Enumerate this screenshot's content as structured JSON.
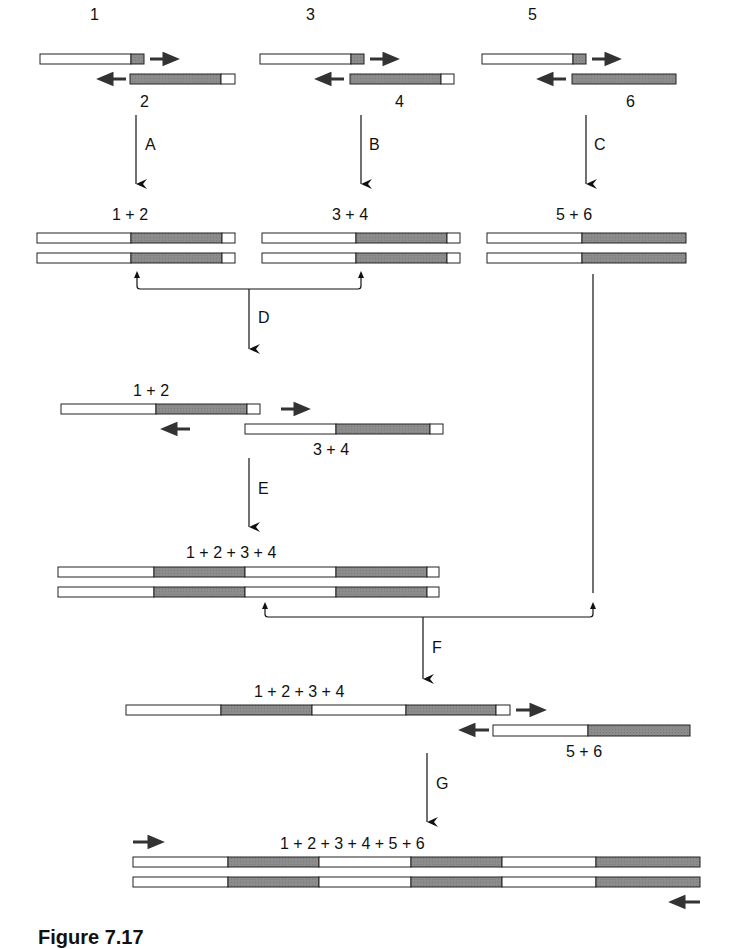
{
  "colors": {
    "white_segment": "#ffffff",
    "dark_segment": "#8a8a8a",
    "stroke": "#222222",
    "arrow": "#333333"
  },
  "fragments": {
    "f1": {
      "label": "1"
    },
    "f2": {
      "label": "2"
    },
    "f3": {
      "label": "3"
    },
    "f4": {
      "label": "4"
    },
    "f5": {
      "label": "5"
    },
    "f6": {
      "label": "6"
    }
  },
  "steps": {
    "A": "A",
    "B": "B",
    "C": "C",
    "D": "D",
    "E": "E",
    "F": "F",
    "G": "G"
  },
  "products": {
    "p12": "1 + 2",
    "p34": "3 + 4",
    "p56": "5 + 6",
    "p12b": "1 + 2",
    "p34b": "3 + 4",
    "p1234": "1 + 2 + 3 + 4",
    "p1234b": "1 + 2 + 3 + 4",
    "p56b": "5 + 6",
    "p123456": "1 + 2 + 3 + 4 + 5 + 6"
  },
  "caption": "Figure 7.17"
}
